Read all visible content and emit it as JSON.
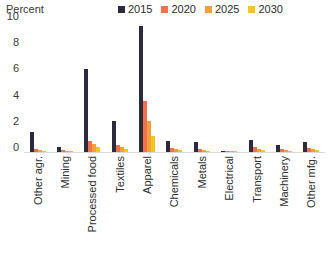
{
  "chart_data": {
    "type": "bar",
    "title": "",
    "ylabel": "Percent",
    "xlabel": "",
    "ylim": [
      0,
      10
    ],
    "yticks": [
      10,
      8,
      6,
      4,
      2,
      0
    ],
    "grid": false,
    "legend_position": "top-right",
    "categories": [
      "Other agr.",
      "Mining",
      "Processed food",
      "Textiles",
      "Apparel",
      "Chemicals",
      "Metals",
      "Electrical",
      "Transport",
      "Machinery",
      "Other mfg."
    ],
    "series": [
      {
        "name": "2015",
        "color": "#2b2b3d",
        "values": [
          1.5,
          0.35,
          6.3,
          2.4,
          9.6,
          0.85,
          0.8,
          0.08,
          0.95,
          0.5,
          0.75
        ]
      },
      {
        "name": "2020",
        "color": "#f2704a",
        "values": [
          0.25,
          0.12,
          0.85,
          0.55,
          3.9,
          0.3,
          0.25,
          0.05,
          0.35,
          0.2,
          0.3
        ]
      },
      {
        "name": "2025",
        "color": "#f0a13c",
        "values": [
          0.15,
          0.08,
          0.62,
          0.35,
          2.4,
          0.2,
          0.15,
          0.04,
          0.22,
          0.14,
          0.2
        ]
      },
      {
        "name": "2030",
        "color": "#f5c518",
        "values": [
          0.1,
          0.05,
          0.42,
          0.22,
          1.2,
          0.12,
          0.1,
          0.03,
          0.15,
          0.09,
          0.14
        ]
      }
    ]
  },
  "axis": {
    "y_title": "Percent"
  },
  "legend": {
    "items": [
      {
        "label": "2015",
        "color": "#2b2b3d"
      },
      {
        "label": "2020",
        "color": "#f2704a"
      },
      {
        "label": "2025",
        "color": "#f0a13c"
      },
      {
        "label": "2030",
        "color": "#f5c518"
      }
    ]
  }
}
